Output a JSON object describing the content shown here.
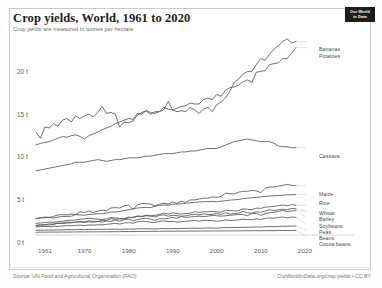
{
  "header": {
    "title": "Crop yields, World, 1961 to 2020",
    "subtitle": "Crop yields are measured in tonnes per hectare",
    "logo_line1": "Our World",
    "logo_line2": "in Data"
  },
  "footer": {
    "source": "Source: UN Food and Agricultural Organization (FAO)",
    "attribution": "OurWorldInData.org/crop-yields • CC BY",
    "caption": ""
  },
  "colors": {
    "line": "#555555",
    "axis": "#cfcfcf",
    "text": "#5b5b5b",
    "frame": "#c9c9c9",
    "badge": "#1d1d1d"
  },
  "chart_data": {
    "type": "line",
    "title": "Crop yields, World, 1961 to 2020",
    "subtitle": "Crop yields are measured in tonnes per hectare",
    "xlabel": "",
    "ylabel": "tonnes per hectare",
    "xlim": [
      1961,
      2020
    ],
    "ylim": [
      0,
      23
    ],
    "grid": false,
    "legend_position": "right-inline",
    "xticks": [
      1961,
      1970,
      1980,
      1990,
      2000,
      2010,
      2020
    ],
    "yticks": [
      0,
      5,
      10,
      15,
      20
    ],
    "ytick_labels": [
      "0 t",
      "5 t",
      "10 t",
      "15 t",
      "20 t"
    ],
    "x": [
      1961,
      1962,
      1963,
      1964,
      1965,
      1966,
      1967,
      1968,
      1969,
      1970,
      1971,
      1972,
      1973,
      1974,
      1975,
      1976,
      1977,
      1978,
      1979,
      1980,
      1981,
      1982,
      1983,
      1984,
      1985,
      1986,
      1987,
      1988,
      1989,
      1990,
      1991,
      1992,
      1993,
      1994,
      1995,
      1996,
      1997,
      1998,
      1999,
      2000,
      2001,
      2002,
      2003,
      2004,
      2005,
      2006,
      2007,
      2008,
      2009,
      2010,
      2011,
      2012,
      2013,
      2014,
      2015,
      2016,
      2017,
      2018,
      2019,
      2020
    ],
    "series": [
      {
        "name": "Bananas",
        "label": "Bananas",
        "values": [
          12.0,
          11.3,
          12.6,
          12.5,
          13.0,
          12.7,
          13.4,
          13.6,
          13.2,
          13.9,
          13.6,
          13.9,
          14.1,
          13.8,
          14.3,
          15.0,
          14.2,
          14.3,
          14.1,
          12.6,
          13.2,
          13.1,
          13.3,
          14.0,
          14.3,
          14.5,
          14.1,
          14.4,
          14.4,
          14.6,
          15.6,
          14.6,
          14.4,
          14.5,
          14.4,
          14.9,
          14.6,
          14.2,
          14.7,
          14.9,
          14.4,
          15.2,
          15.5,
          16.0,
          16.8,
          17.8,
          18.2,
          18.8,
          19.1,
          19.1,
          19.9,
          20.6,
          20.4,
          21.1,
          21.7,
          22.1,
          22.6,
          22.9,
          22.4,
          22.6
        ]
      },
      {
        "name": "Potatoes",
        "label": "Potatoes",
        "values": [
          10.5,
          10.7,
          10.8,
          10.9,
          11.1,
          11.3,
          11.5,
          11.4,
          11.6,
          11.7,
          11.5,
          11.2,
          11.6,
          11.8,
          12.0,
          12.3,
          12.5,
          12.7,
          13.0,
          13.2,
          13.4,
          13.6,
          13.5,
          14.2,
          14.1,
          14.5,
          14.3,
          14.2,
          14.4,
          14.9,
          14.7,
          14.6,
          14.8,
          15.0,
          15.1,
          15.4,
          15.3,
          15.3,
          15.8,
          16.0,
          15.8,
          16.4,
          16.2,
          16.9,
          17.2,
          17.3,
          17.5,
          17.9,
          18.1,
          17.8,
          19.0,
          19.1,
          19.2,
          19.9,
          20.0,
          20.1,
          20.6,
          20.6,
          21.2,
          21.9
        ]
      },
      {
        "name": "Cassava",
        "label": "Cassava",
        "values": [
          7.5,
          7.6,
          7.7,
          7.8,
          7.9,
          8.0,
          8.1,
          8.2,
          8.3,
          8.5,
          8.5,
          8.5,
          8.6,
          8.7,
          8.8,
          8.7,
          8.6,
          8.7,
          8.8,
          8.8,
          8.9,
          9.0,
          9.0,
          9.0,
          9.1,
          9.2,
          9.2,
          9.3,
          9.4,
          9.5,
          9.5,
          9.5,
          9.6,
          9.7,
          9.7,
          9.8,
          9.8,
          9.9,
          10.0,
          10.1,
          10.1,
          10.1,
          10.3,
          10.5,
          10.7,
          10.9,
          11.0,
          11.1,
          11.2,
          11.1,
          11.0,
          10.9,
          10.9,
          10.9,
          10.7,
          10.4,
          10.3,
          10.3,
          10.2,
          10.2
        ]
      },
      {
        "name": "Maize",
        "label": "Maize",
        "values": [
          1.94,
          2.0,
          2.1,
          2.05,
          2.18,
          2.33,
          2.38,
          2.35,
          2.45,
          2.4,
          2.7,
          2.62,
          2.8,
          2.6,
          2.79,
          2.9,
          2.83,
          3.15,
          3.2,
          3.15,
          3.4,
          3.5,
          3.0,
          3.5,
          3.7,
          3.66,
          3.6,
          3.4,
          3.6,
          3.7,
          3.6,
          3.85,
          3.7,
          3.95,
          3.8,
          4.1,
          4.1,
          4.2,
          4.3,
          4.3,
          4.45,
          4.4,
          4.5,
          4.9,
          4.8,
          4.8,
          5.0,
          5.1,
          5.1,
          5.2,
          5.15,
          4.95,
          5.45,
          5.6,
          5.6,
          5.7,
          5.8,
          5.9,
          5.8,
          5.75
        ]
      },
      {
        "name": "Rice",
        "label": "Rice",
        "values": [
          1.87,
          2.0,
          2.02,
          2.05,
          1.98,
          2.1,
          2.15,
          2.18,
          2.2,
          2.38,
          2.35,
          2.3,
          2.4,
          2.42,
          2.5,
          2.47,
          2.55,
          2.7,
          2.68,
          2.75,
          2.85,
          2.95,
          3.05,
          3.15,
          3.2,
          3.22,
          3.2,
          3.35,
          3.45,
          3.5,
          3.48,
          3.6,
          3.62,
          3.65,
          3.7,
          3.75,
          3.82,
          3.85,
          3.9,
          3.9,
          3.92,
          3.88,
          3.95,
          4.0,
          4.08,
          4.1,
          4.15,
          4.25,
          4.3,
          4.35,
          4.4,
          4.45,
          4.5,
          4.55,
          4.58,
          4.6,
          4.65,
          4.68,
          4.7,
          4.72
        ]
      },
      {
        "name": "Wheat",
        "label": "Wheat",
        "values": [
          1.09,
          1.16,
          1.18,
          1.3,
          1.24,
          1.38,
          1.4,
          1.5,
          1.48,
          1.5,
          1.58,
          1.55,
          1.63,
          1.6,
          1.57,
          1.72,
          1.7,
          1.9,
          1.85,
          1.85,
          1.88,
          2.0,
          2.08,
          2.2,
          2.18,
          2.3,
          2.25,
          2.3,
          2.4,
          2.55,
          2.45,
          2.6,
          2.5,
          2.45,
          2.5,
          2.55,
          2.7,
          2.65,
          2.7,
          2.72,
          2.75,
          2.7,
          2.65,
          2.9,
          2.85,
          2.8,
          2.85,
          3.05,
          3.0,
          2.95,
          3.15,
          3.1,
          3.25,
          3.3,
          3.35,
          3.42,
          3.5,
          3.42,
          3.55,
          3.48
        ]
      },
      {
        "name": "Barley",
        "label": "Barley",
        "values": [
          1.35,
          1.4,
          1.45,
          1.5,
          1.48,
          1.55,
          1.6,
          1.7,
          1.72,
          1.75,
          1.85,
          1.88,
          1.95,
          1.9,
          1.85,
          1.8,
          1.9,
          2.05,
          2.0,
          1.95,
          1.9,
          2.1,
          2.0,
          2.2,
          2.15,
          2.25,
          2.2,
          2.1,
          2.3,
          2.35,
          2.2,
          2.3,
          2.25,
          2.2,
          2.25,
          2.35,
          2.4,
          2.35,
          2.45,
          2.4,
          2.42,
          2.5,
          2.4,
          2.6,
          2.45,
          2.5,
          2.55,
          2.75,
          2.6,
          2.55,
          2.7,
          2.65,
          2.8,
          2.95,
          2.85,
          2.95,
          3.0,
          2.95,
          3.1,
          3.05
        ]
      },
      {
        "name": "Soybeans",
        "label": "Soybeans",
        "values": [
          1.13,
          1.18,
          1.2,
          1.15,
          1.3,
          1.35,
          1.33,
          1.4,
          1.42,
          1.48,
          1.52,
          1.45,
          1.55,
          1.5,
          1.58,
          1.5,
          1.62,
          1.6,
          1.75,
          1.6,
          1.78,
          1.85,
          1.65,
          1.8,
          1.9,
          1.95,
          1.85,
          1.7,
          1.9,
          1.9,
          1.95,
          2.05,
          1.95,
          2.15,
          2.05,
          2.1,
          2.15,
          2.2,
          2.15,
          2.2,
          2.3,
          2.25,
          2.2,
          2.25,
          2.3,
          2.35,
          2.4,
          2.4,
          2.25,
          2.5,
          2.5,
          2.3,
          2.5,
          2.6,
          2.65,
          2.75,
          2.85,
          2.75,
          2.8,
          2.85
        ]
      },
      {
        "name": "Peas",
        "label": "Peas",
        "values": [
          0.95,
          0.98,
          1.0,
          0.97,
          1.02,
          1.0,
          1.05,
          1.1,
          1.08,
          1.12,
          1.15,
          1.1,
          1.18,
          1.15,
          1.2,
          1.18,
          1.25,
          1.3,
          1.35,
          1.28,
          1.4,
          1.45,
          1.38,
          1.55,
          1.6,
          1.58,
          1.5,
          1.45,
          1.6,
          1.65,
          1.55,
          1.6,
          1.5,
          1.55,
          1.6,
          1.65,
          1.7,
          1.62,
          1.72,
          1.7,
          1.68,
          1.6,
          1.65,
          1.75,
          1.7,
          1.72,
          1.78,
          1.85,
          1.8,
          1.78,
          1.9,
          1.8,
          1.95,
          2.0,
          1.95,
          2.05,
          2.1,
          2.0,
          2.1,
          2.05
        ]
      },
      {
        "name": "Beans",
        "label": "Beans",
        "values": [
          0.55,
          0.56,
          0.57,
          0.58,
          0.58,
          0.6,
          0.6,
          0.62,
          0.62,
          0.63,
          0.64,
          0.63,
          0.65,
          0.65,
          0.66,
          0.66,
          0.67,
          0.68,
          0.68,
          0.66,
          0.68,
          0.7,
          0.68,
          0.72,
          0.72,
          0.73,
          0.72,
          0.7,
          0.74,
          0.75,
          0.73,
          0.76,
          0.74,
          0.76,
          0.78,
          0.78,
          0.8,
          0.78,
          0.8,
          0.82,
          0.82,
          0.8,
          0.84,
          0.86,
          0.86,
          0.88,
          0.88,
          0.9,
          0.9,
          0.92,
          0.94,
          0.92,
          0.96,
          0.98,
          0.98,
          1.0,
          1.02,
          1.02,
          1.04,
          1.05
        ]
      },
      {
        "name": "Cocoa beans",
        "label": "Cocoa beans",
        "values": [
          0.32,
          0.33,
          0.33,
          0.34,
          0.34,
          0.34,
          0.35,
          0.35,
          0.35,
          0.36,
          0.36,
          0.36,
          0.37,
          0.37,
          0.37,
          0.38,
          0.38,
          0.38,
          0.39,
          0.39,
          0.4,
          0.4,
          0.4,
          0.41,
          0.41,
          0.42,
          0.42,
          0.43,
          0.43,
          0.44,
          0.44,
          0.44,
          0.45,
          0.45,
          0.45,
          0.46,
          0.46,
          0.46,
          0.47,
          0.47,
          0.47,
          0.47,
          0.48,
          0.48,
          0.48,
          0.49,
          0.49,
          0.49,
          0.5,
          0.5,
          0.5,
          0.5,
          0.51,
          0.51,
          0.51,
          0.52,
          0.52,
          0.52,
          0.53,
          0.53
        ]
      }
    ]
  }
}
